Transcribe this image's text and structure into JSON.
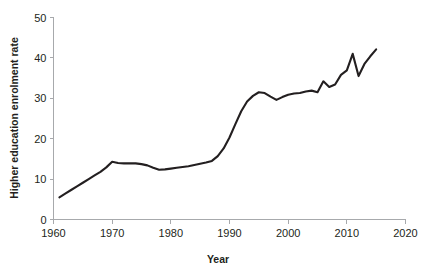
{
  "chart_data": {
    "type": "line",
    "title": "",
    "xlabel": "Year",
    "ylabel": "Higher education enrolment rate",
    "xlim": [
      1960,
      2020
    ],
    "ylim": [
      0,
      50
    ],
    "xticks": [
      1960,
      1970,
      1980,
      1990,
      2000,
      2010,
      2020
    ],
    "xtick_labels": [
      "1960",
      "1970",
      "1980",
      "1990",
      "2000",
      "2010",
      "2020"
    ],
    "yticks": [
      0,
      10,
      20,
      30,
      40,
      50
    ],
    "ytick_labels": [
      "0",
      "10",
      "20",
      "30",
      "40",
      "50"
    ],
    "grid": false,
    "legend": false,
    "legend_position": "none",
    "line_color": "#231f20",
    "axis_color": "#a7a9ac",
    "series": [
      {
        "name": "Higher education enrolment rate",
        "x": [
          1961,
          1962,
          1963,
          1964,
          1965,
          1966,
          1967,
          1968,
          1969,
          1970,
          1971,
          1972,
          1973,
          1974,
          1975,
          1976,
          1977,
          1978,
          1979,
          1980,
          1981,
          1982,
          1983,
          1984,
          1985,
          1986,
          1987,
          1988,
          1989,
          1990,
          1991,
          1992,
          1993,
          1994,
          1995,
          1996,
          1997,
          1998,
          1999,
          2000,
          2001,
          2002,
          2003,
          2004,
          2005,
          2006,
          2007,
          2008,
          2009,
          2010,
          2011,
          2012,
          2013,
          2014,
          2015
        ],
        "values": [
          5.5,
          6.4,
          7.3,
          8.2,
          9.1,
          10.0,
          10.9,
          11.8,
          12.9,
          14.3,
          14.0,
          13.9,
          13.9,
          13.9,
          13.7,
          13.4,
          12.8,
          12.3,
          12.4,
          12.6,
          12.8,
          13.0,
          13.2,
          13.5,
          13.8,
          14.1,
          14.5,
          15.7,
          17.6,
          20.3,
          23.6,
          26.8,
          29.2,
          30.6,
          31.5,
          31.3,
          30.4,
          29.6,
          30.3,
          30.9,
          31.2,
          31.3,
          31.7,
          31.9,
          31.5,
          34.2,
          32.8,
          33.4,
          35.8,
          36.9,
          41.0,
          35.5,
          38.5,
          40.4,
          42.1
        ]
      }
    ]
  },
  "axes": {
    "y_title": "Higher education enrolment rate",
    "x_title": "Year"
  }
}
